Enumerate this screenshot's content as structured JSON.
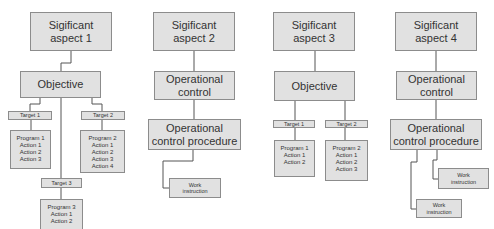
{
  "diagram": {
    "colors": {
      "box_fill": "#e1e1e1",
      "box_border": "#8c8c8c",
      "line": "#555555",
      "text": "#333333"
    },
    "columns": [
      {
        "aspect": [
          "Sigificant",
          "aspect 1"
        ],
        "level2": [
          "Objective"
        ],
        "targets": [
          {
            "label": "Target 1",
            "program": "Program 1",
            "actions": [
              "Action 1",
              "Action 2",
              "Action 3"
            ]
          },
          {
            "label": "Target 2",
            "program": "Program 2",
            "actions": [
              "Action 1",
              "Action 2",
              "Action 3",
              "Action 4"
            ]
          },
          {
            "label": "Target 3",
            "program": "Program 3",
            "actions": [
              "Action 1",
              "Action 2"
            ]
          }
        ]
      },
      {
        "aspect": [
          "Sigificant",
          "aspect 2"
        ],
        "level2": [
          "Operational",
          "control"
        ],
        "procedure": [
          "Operational",
          "control procedure"
        ],
        "work_instructions": [
          [
            "Work",
            "instruction"
          ]
        ]
      },
      {
        "aspect": [
          "Sigificant",
          "aspect 3"
        ],
        "level2": [
          "Objective"
        ],
        "targets": [
          {
            "label": "Target 1",
            "program": "Program 1",
            "actions": [
              "Action 1",
              "Action 2"
            ]
          },
          {
            "label": "Target 2",
            "program": "Program 2",
            "actions": [
              "Action 1",
              "Action 2",
              "Action 3"
            ]
          }
        ]
      },
      {
        "aspect": [
          "Sigificant",
          "aspect 4"
        ],
        "level2": [
          "Operational",
          "control"
        ],
        "procedure": [
          "Operational",
          "control procedure"
        ],
        "work_instructions": [
          [
            "Work",
            "instruction"
          ],
          [
            "Work",
            "instruction"
          ]
        ]
      }
    ]
  }
}
